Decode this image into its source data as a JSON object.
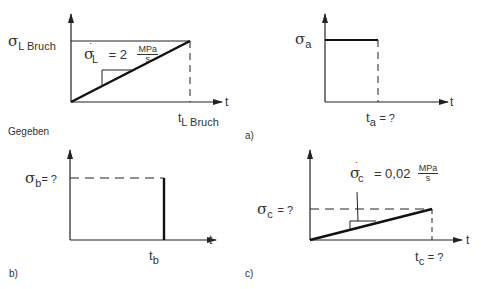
{
  "given": {
    "section_label": "Gegeben",
    "sigma_label": "σ",
    "sigma_sub": "L Bruch",
    "rate_sigma": "σ",
    "rate_sub": "L",
    "rate_dot": "˙",
    "rate_eq": "= 2",
    "rate_unit_num": "MPa",
    "rate_unit_den": "s",
    "t_axis": "t",
    "t_label": "t",
    "t_sub": "L Bruch"
  },
  "panel_a": {
    "tag": "a)",
    "sigma_label": "σ",
    "sigma_sub": "a",
    "t_axis": "t",
    "t_label": "t",
    "t_sub": "a",
    "t_eq": "= ?"
  },
  "panel_b": {
    "tag": "b)",
    "sigma_label": "σ",
    "sigma_sub": "b",
    "sigma_eq": "= ?",
    "t_axis": "t",
    "t_label": "t",
    "t_sub": "b"
  },
  "panel_c": {
    "tag": "c)",
    "sigma_label": "σ",
    "sigma_sub": "c",
    "sigma_eq": "= ?",
    "rate_sigma": "σ",
    "rate_sub": "c",
    "rate_dot": "˙",
    "rate_eq": "= 0,02",
    "rate_unit_num": "MPa",
    "rate_unit_den": "s",
    "t_axis": "t",
    "t_label": "t",
    "t_sub": "c",
    "t_eq": "= ?"
  },
  "colors": {
    "line": "#222222",
    "text": "#333333"
  }
}
